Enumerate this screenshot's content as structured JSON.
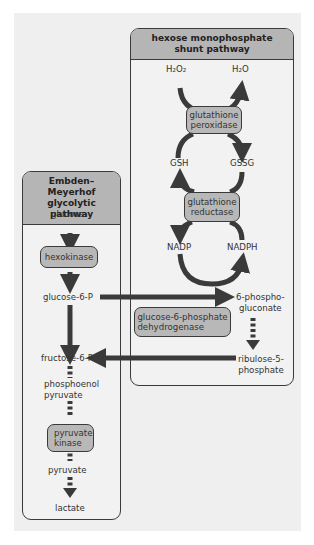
{
  "hmp_panel": {
    "title_line1": "hexose monophosphate",
    "title_line2": "shunt pathway",
    "metabolites": {
      "h2o2": "H₂O₂",
      "h2o": "H₂O",
      "gsh": "GSH",
      "gssg": "GSSG",
      "nadp": "NADP",
      "nadph": "NADPH",
      "phosphogluconate_line1": "6-phospho-",
      "phosphogluconate_line2": "gluconate",
      "ribulose_line1": "ribulose-5-",
      "ribulose_line2": "phosphate"
    },
    "enzymes": {
      "peroxidase_line1": "glutathione",
      "peroxidase_line2": "peroxidase",
      "reductase_line1": "glutathione",
      "reductase_line2": "reductase",
      "g6pd_line1": "glucose-6-phosphate",
      "g6pd_line2": "dehydrogenase"
    }
  },
  "em_panel": {
    "title_line1": "Embden–Meyerhof",
    "title_line2": "glycolytic pathway",
    "metabolites": {
      "glucose": "glucose",
      "glucose6p": "glucose-6-P",
      "fructose6p": "fructose-6-P",
      "pep_line1": "phosphoenol",
      "pep_line2": "pyruvate",
      "pyruvate": "pyruvate",
      "lactate": "lactate"
    },
    "enzymes": {
      "hexokinase": "hexokinase",
      "pk_line1": "pyruvate",
      "pk_line2": "kinase"
    }
  },
  "colors": {
    "background": "#efefef",
    "panel_header": "#b5b5b5",
    "enzyme_fill": "#b8b8b8",
    "arrow": "#3a3a3a"
  }
}
